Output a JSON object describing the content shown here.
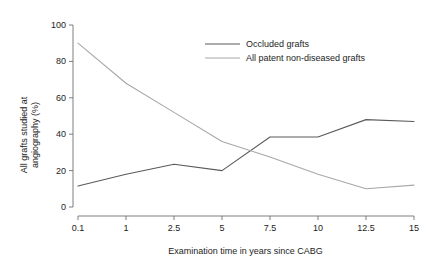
{
  "chart_data": {
    "type": "line",
    "title": "",
    "xlabel": "Examination time in years since CABG",
    "ylabel": "All grafts studied at angiography (%)",
    "ylabel_line1": "All grafts studied at",
    "ylabel_line2": "angiography (%)",
    "categories": [
      "0.1",
      "1",
      "2.5",
      "5",
      "7.5",
      "10",
      "12.5",
      "15"
    ],
    "x": [
      0.1,
      1,
      2.5,
      5,
      7.5,
      10,
      12.5,
      15
    ],
    "x_spacing": "categorical",
    "ylim": [
      0,
      100
    ],
    "yticks": [
      0,
      20,
      40,
      60,
      80,
      100
    ],
    "ytick_labels": [
      "0",
      "20",
      "40",
      "60",
      "80",
      "100"
    ],
    "grid": false,
    "legend_position": "top-center",
    "series": [
      {
        "name": "Occluded grafts",
        "color": "#5a5a5a",
        "values": [
          11.5,
          18,
          23.5,
          20,
          38.5,
          38.5,
          48,
          47
        ]
      },
      {
        "name": "All patent non-diseased grafts",
        "color": "#a8a8a8",
        "values": [
          90,
          68,
          52,
          36,
          27.5,
          18,
          10,
          12
        ]
      }
    ]
  },
  "axes": {
    "y_tick_0": "0",
    "y_tick_1": "20",
    "y_tick_2": "40",
    "y_tick_3": "60",
    "y_tick_4": "80",
    "y_tick_5": "100",
    "x_tick_0": "0.1",
    "x_tick_1": "1",
    "x_tick_2": "2.5",
    "x_tick_3": "5",
    "x_tick_4": "7.5",
    "x_tick_5": "10",
    "x_tick_6": "12.5",
    "x_tick_7": "15"
  },
  "legend": {
    "entries": [
      {
        "label": "Occluded grafts",
        "color": "#5a5a5a"
      },
      {
        "label": "All patent non-diseased grafts",
        "color": "#a8a8a8"
      }
    ]
  },
  "colors": {
    "background": "#ffffff",
    "axis": "#6f6f6f",
    "text": "#1c1c1c",
    "series_occluded": "#5a5a5a",
    "series_patent": "#a8a8a8"
  }
}
